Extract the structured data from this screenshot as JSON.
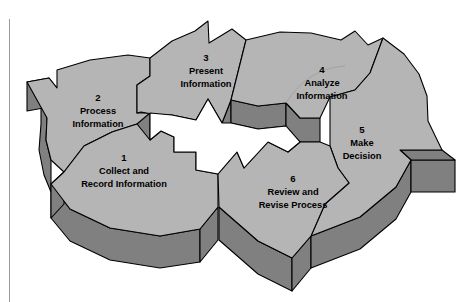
{
  "diagram": {
    "kind": "process-cycle-diagram",
    "title_visible": false,
    "shape": "3d-circular-six-segment-arrow-cycle",
    "direction": "clockwise",
    "colors": {
      "top_face": "#b5b5b5",
      "side_face": "#808080",
      "outline": "#000000",
      "background": "#ffffff",
      "hub": "#ffffff",
      "page_rule": "#9a9a9a"
    },
    "steps": [
      {
        "number": "1",
        "line1": "Collect and",
        "line2": "Record Information",
        "num_x": 124,
        "num_y": 158,
        "l1_x": 124,
        "l1_y": 172,
        "l2_x": 124,
        "l2_y": 185
      },
      {
        "number": "2",
        "line1": "Process",
        "line2": "Information",
        "num_x": 98,
        "num_y": 98,
        "l1_x": 98,
        "l1_y": 112,
        "l2_x": 98,
        "l2_y": 125
      },
      {
        "number": "3",
        "line1": "Present",
        "line2": "Information",
        "num_x": 206,
        "num_y": 58,
        "l1_x": 206,
        "l1_y": 72,
        "l2_x": 206,
        "l2_y": 85
      },
      {
        "number": "4",
        "line1": "Analyze",
        "line2": "Information",
        "num_x": 322,
        "num_y": 70,
        "l1_x": 322,
        "l1_y": 84,
        "l2_x": 322,
        "l2_y": 97
      },
      {
        "number": "5",
        "line1": "Make",
        "line2": "Decision",
        "num_x": 362,
        "num_y": 130,
        "l1_x": 362,
        "l1_y": 144,
        "l2_x": 362,
        "l2_y": 157
      },
      {
        "number": "6",
        "line1": "Review and",
        "line2": "Revise Process",
        "num_x": 293,
        "num_y": 179,
        "l1_x": 293,
        "l1_y": 193,
        "l2_x": 293,
        "l2_y": 206
      }
    ]
  }
}
